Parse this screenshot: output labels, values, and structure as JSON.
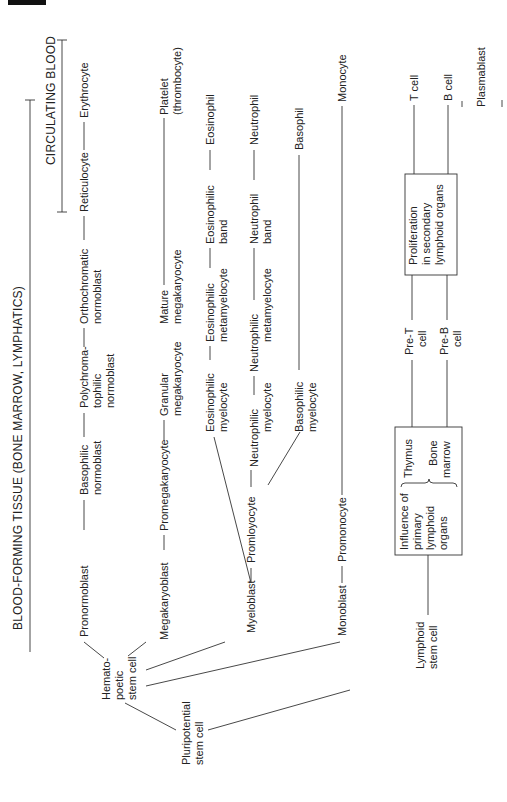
{
  "diagram": {
    "orientation": "rotated 90deg counter-clockwise",
    "headers": {
      "blood_forming_tissue": "BLOOD-FORMING TISSUE (BONE MARROW, LYMPHATICS)",
      "circulating_blood": "CIRCULATING BLOOD"
    },
    "roots": {
      "pluripotential": [
        "Pluripotential",
        "stem cell"
      ],
      "hematopoetic": [
        "Hemato-",
        "poetic",
        "stem cell"
      ],
      "lymphoid": [
        "Lymphoid",
        "stem cell"
      ]
    },
    "erythroid": {
      "pronormoblast": "Pronormoblast",
      "basophilic": [
        "Basophilic",
        "normoblast"
      ],
      "polychromatophilic": [
        "Polychroma-",
        "tophilic",
        "normoblast"
      ],
      "orthochromatic": [
        "Orthochromatic",
        "normoblast"
      ],
      "reticulocyte": "Reticulocyte",
      "erythrocyte": "Erythrocyte"
    },
    "megakaryocytic": {
      "megakaryoblast": "Megakaryoblast",
      "promegakaryocyte": "Promegakaryocyte",
      "granular": [
        "Granular",
        "megakaryocyte"
      ],
      "mature": [
        "Mature",
        "megakaryocyte"
      ],
      "platelet": [
        "Platelet",
        "(thrombocyte)"
      ]
    },
    "granulocytic": {
      "myeloblast": "Myeloblast",
      "promyelocyte": "Promloyocyte",
      "eos_myelocyte": [
        "Eosinophilic",
        "myelocyte"
      ],
      "eos_metamyelocyte": [
        "Eosinophilic",
        "metamyelocyte"
      ],
      "eos_band": [
        "Eosinophilic",
        "band"
      ],
      "eosinophil": "Eosinophil",
      "neu_myelocyte": [
        "Neutrophilic",
        "myelocyte"
      ],
      "neu_metamyelocyte": [
        "Neutrophilic",
        "metamyelocyte"
      ],
      "neu_band": [
        "Neutrophil",
        "band"
      ],
      "neutrophil": "Neutrophil",
      "baso_myelocyte": [
        "Basophilic",
        "myelocyte"
      ],
      "basophil": "Basophil"
    },
    "monocytic": {
      "monoblast": "Monoblast",
      "promonocyte": "Promonocyte",
      "monocyte": "Monocyte"
    },
    "lymphoid": {
      "primary_box": [
        "Influence of",
        "primary",
        "lymphoid",
        "organs"
      ],
      "thymus": "Thymus",
      "bone_marrow": [
        "Bone",
        "marrow"
      ],
      "pre_t": [
        "Pre-T",
        "cell"
      ],
      "pre_b": [
        "Pre-B",
        "cell"
      ],
      "secondary_box": [
        "Proliferation",
        "in secondary",
        "lymphoid organs"
      ],
      "t_cell": "T  cell",
      "b_cell": "B  cell",
      "plasmablast": "Plasmablast"
    }
  }
}
